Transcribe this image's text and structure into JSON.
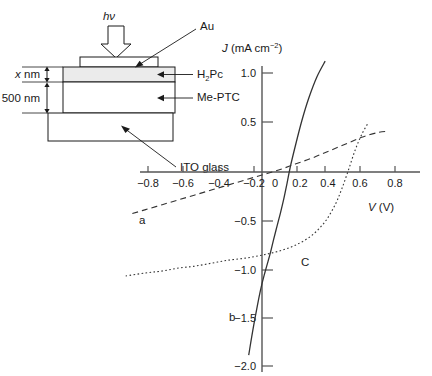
{
  "figure": {
    "device": {
      "light_label": "hν",
      "layers": [
        {
          "name": "Au",
          "label": "Au"
        },
        {
          "name": "H2Pc",
          "label": "H",
          "label_sub": "2",
          "label_rest": "Pc"
        },
        {
          "name": "Me-PTC",
          "label": "Me-PTC"
        },
        {
          "name": "ITO glass",
          "label": "ITO glass"
        }
      ],
      "dimensions": [
        {
          "label_italic": "x",
          "label_rest": " nm"
        },
        {
          "label_italic": "",
          "label_rest": "500 nm"
        }
      ]
    },
    "axes": {
      "y_label_italic": "J",
      "y_label_rest": " (mA cm",
      "y_label_sup": "−2",
      "y_label_tail": ")",
      "x_label_italic": "V",
      "x_label_rest": " (V)",
      "x_ticks": [
        "−0.8",
        "−0.6",
        "−0.4",
        "−0.2",
        "0",
        "0.2",
        "0.4",
        "0.6",
        "0.8"
      ],
      "y_ticks": [
        "1.0",
        "0.5",
        "0",
        "−0.5",
        "−1.0",
        "−1.5",
        "−2.0"
      ]
    },
    "curve_labels": [
      {
        "name": "curve-a",
        "label": "a"
      },
      {
        "name": "curve-b",
        "label": "b"
      },
      {
        "name": "curve-c",
        "label": "C"
      }
    ]
  },
  "chart_data": {
    "type": "line",
    "title": "",
    "xlabel": "V (V)",
    "ylabel": "J (mA cm^-2)",
    "xlim": [
      -1.0,
      0.95
    ],
    "ylim": [
      -2.0,
      1.15
    ],
    "grid": false,
    "legend": "inline-annotations",
    "xticks": [
      -0.8,
      -0.6,
      -0.4,
      -0.2,
      0,
      0.2,
      0.4,
      0.6,
      0.8
    ],
    "yticks": [
      1.0,
      0.5,
      0,
      -0.5,
      -1.0,
      -1.5,
      -2.0
    ],
    "series": [
      {
        "name": "a",
        "style": "dashed",
        "label": "a",
        "x": [
          -0.78,
          -0.7,
          -0.6,
          -0.5,
          -0.4,
          -0.3,
          -0.2,
          -0.1,
          0.0,
          0.1,
          0.2,
          0.3,
          0.4,
          0.5,
          0.6,
          0.7,
          0.76
        ],
        "y": [
          -0.42,
          -0.38,
          -0.33,
          -0.28,
          -0.23,
          -0.18,
          -0.13,
          -0.08,
          -0.03,
          0.02,
          0.08,
          0.14,
          0.21,
          0.28,
          0.35,
          0.4,
          0.41
        ]
      },
      {
        "name": "b",
        "style": "solid",
        "label": "b",
        "x": [
          -0.08,
          -0.05,
          -0.01,
          0.02,
          0.05,
          0.07,
          0.09,
          0.11,
          0.13,
          0.15,
          0.17,
          0.2,
          0.24,
          0.28,
          0.33,
          0.38
        ],
        "y": [
          -1.85,
          -1.55,
          -1.2,
          -1.0,
          -0.82,
          -0.68,
          -0.55,
          -0.42,
          -0.28,
          -0.12,
          0.05,
          0.26,
          0.52,
          0.74,
          0.96,
          1.12
        ]
      },
      {
        "name": "C",
        "style": "dotted",
        "label": "C",
        "x": [
          -0.82,
          -0.7,
          -0.6,
          -0.5,
          -0.4,
          -0.3,
          -0.2,
          -0.1,
          0.0,
          0.1,
          0.2,
          0.3,
          0.38,
          0.44,
          0.48,
          0.52,
          0.56,
          0.6,
          0.64
        ],
        "y": [
          -1.05,
          -1.02,
          -1.0,
          -0.97,
          -0.95,
          -0.92,
          -0.89,
          -0.87,
          -0.84,
          -0.8,
          -0.74,
          -0.64,
          -0.5,
          -0.33,
          -0.17,
          0.02,
          0.22,
          0.38,
          0.5
        ]
      }
    ],
    "annotations": [
      {
        "text": "a",
        "x": -0.72,
        "y": -0.52
      },
      {
        "text": "b",
        "x": -0.18,
        "y": -1.5
      },
      {
        "text": "C",
        "x": 0.26,
        "y": -0.95
      }
    ]
  }
}
